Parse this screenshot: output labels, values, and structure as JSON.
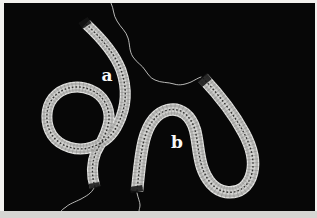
{
  "figure": {
    "labels": [
      {
        "text": "a",
        "x": 107,
        "y": 81
      },
      {
        "text": "b",
        "x": 177,
        "y": 148
      }
    ]
  },
  "colors": {
    "frame": "#f2f1ee",
    "frame_bottom": "#d6d5d2",
    "photo_background": "#070707",
    "ribbon_edge": "#e4e4e2",
    "ribbon_body": "#b4b4b2",
    "ribbon_core": "#d2d2d0",
    "ribbon_striation": "#7e7e7c",
    "ribbon_midline": "#2e2e2c",
    "tip": "#141414",
    "thread": "#dcdcda",
    "label_text": "#fafafa"
  },
  "photo_rect": {
    "x": 4,
    "y": 3,
    "w": 311,
    "h": 208
  },
  "specimens": {
    "a": {
      "name": "specimen-a",
      "path": "M 86,24 C 99,36 114,52 121,70 C 128,90 126,108 118,124 C 113,135 104,143 92,147 C 78,152 60,147 52,135 C 45,124 45,108 53,98 C 62,87 78,84 91,90 C 103,95 110,107 109,120 C 108,131 102,141 96,152 C 92,162 91,174 95,187",
      "tip_start": "M 83,20 L 87,26",
      "tip_end": "M 94,183 L 95,188",
      "edge_width": 11,
      "body_width": 8.5,
      "core_width": 4.2,
      "striation_width": 10
    },
    "b": {
      "name": "specimen-b",
      "path": "M 137,191 C 139,173 140,156 144,140 C 148,125 156,113 168,110 C 181,107 191,116 195,130 C 198,141 198,154 202,167 C 206,179 214,190 226,192 C 239,194 249,186 252,173 C 255,161 251,146 244,133 C 235,116 220,96 203,78",
      "tip_start": "M 136,186 L 137,192",
      "tip_end": "M 207,83 L 202,77",
      "edge_width": 12.5,
      "body_width": 10,
      "core_width": 5,
      "striation_width": 11.5
    }
  },
  "threads": [
    {
      "name": "thread-top",
      "path": "M 111,3 C 114,9 113,15 117,21 C 121,28 126,31 128,38 C 130,44 129,51 133,57 C 137,63 142,65 145,70 C 148,74 150,78 155,80 C 161,83 168,82 174,84 C 180,86 186,84 191,82 C 195,80 198,78 201,77"
    },
    {
      "name": "thread-bottom-left",
      "path": "M 94,188 C 91,194 86,196 81,199 C 75,202 69,204 66,207 C 63,209 62,210 61,211"
    },
    {
      "name": "thread-bottom-center",
      "path": "M 137,193 C 138,198 140,202 140,205 C 140,208 139,209 139,211"
    }
  ]
}
